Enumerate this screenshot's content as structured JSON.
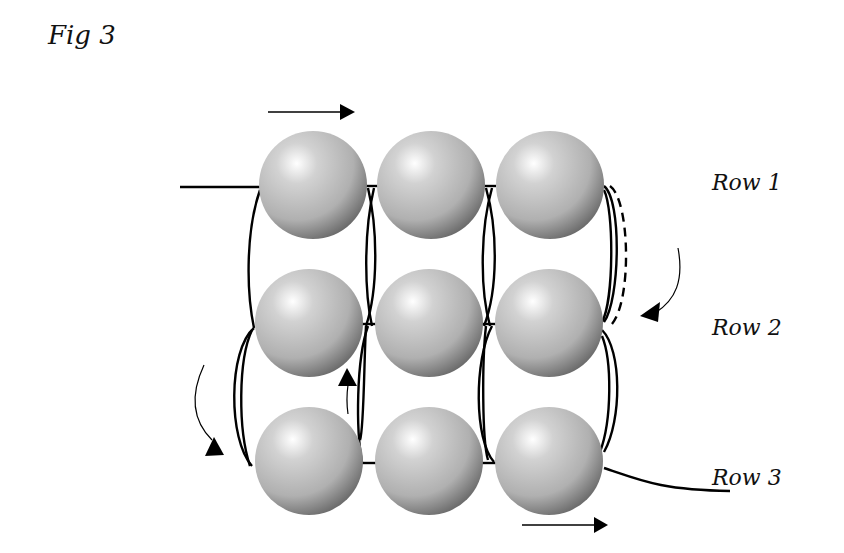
{
  "figure": {
    "title": "Fig 3",
    "rows": [
      {
        "label": "Row 1",
        "bead_count": 3
      },
      {
        "label": "Row 2",
        "bead_count": 3
      },
      {
        "label": "Row 3",
        "bead_count": 3
      }
    ],
    "bead_colors": {
      "highlight": "#ffffff",
      "mid": "#b0b0b0",
      "shadow": "#6a6a6a"
    },
    "thread_color": "#000000",
    "arrows": [
      {
        "name": "top-direction-arrow",
        "direction": "right"
      },
      {
        "name": "right-turn-arrow",
        "direction": "down-left"
      },
      {
        "name": "left-turn-arrow",
        "direction": "down-right"
      },
      {
        "name": "middle-up-arrow",
        "direction": "up"
      },
      {
        "name": "bottom-direction-arrow",
        "direction": "right"
      }
    ]
  }
}
